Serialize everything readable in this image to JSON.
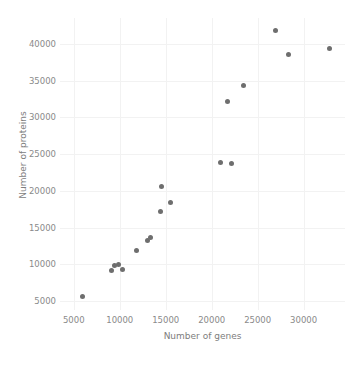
{
  "chart_data": {
    "type": "scatter",
    "title": "",
    "xlabel": "Number of genes",
    "ylabel": "Number of proteins",
    "xlim": [
      3500,
      34500
    ],
    "ylim": [
      3800,
      43500
    ],
    "xticks": [
      5000,
      10000,
      15000,
      20000,
      25000,
      30000
    ],
    "yticks": [
      5000,
      10000,
      15000,
      20000,
      25000,
      30000,
      35000,
      40000
    ],
    "xtick_labels": [
      "5000",
      "10000",
      "15000",
      "20000",
      "25000",
      "30000"
    ],
    "ytick_labels": [
      "5000",
      "10000",
      "15000",
      "20000",
      "25000",
      "30000",
      "35000",
      "40000"
    ],
    "grid": true,
    "legend": null,
    "marker_color": "#6e6e6e",
    "marker_size": 5,
    "points": [
      {
        "x": 5900,
        "y": 5600
      },
      {
        "x": 9100,
        "y": 9200
      },
      {
        "x": 9400,
        "y": 9800
      },
      {
        "x": 9900,
        "y": 10050
      },
      {
        "x": 10300,
        "y": 9300
      },
      {
        "x": 11800,
        "y": 11900
      },
      {
        "x": 13000,
        "y": 13300
      },
      {
        "x": 13300,
        "y": 13600
      },
      {
        "x": 14400,
        "y": 17200
      },
      {
        "x": 14500,
        "y": 20600
      },
      {
        "x": 15500,
        "y": 18400
      },
      {
        "x": 21000,
        "y": 23800
      },
      {
        "x": 21700,
        "y": 32200
      },
      {
        "x": 22200,
        "y": 23700
      },
      {
        "x": 23500,
        "y": 34300
      },
      {
        "x": 26900,
        "y": 41800
      },
      {
        "x": 28300,
        "y": 38500
      },
      {
        "x": 32800,
        "y": 39300
      }
    ]
  }
}
